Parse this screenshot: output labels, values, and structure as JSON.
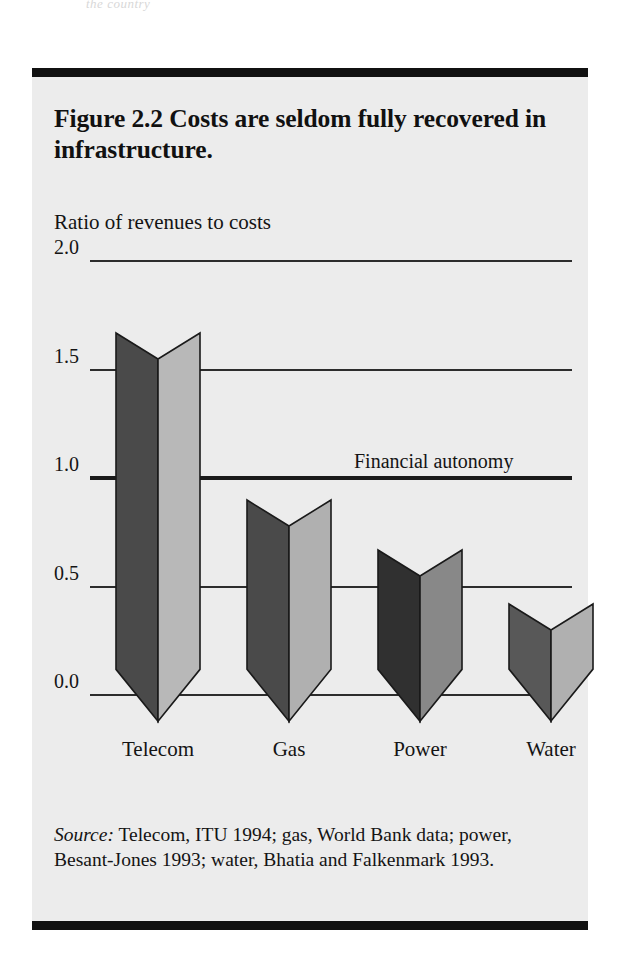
{
  "figure": {
    "title": "Figure 2.2  Costs are seldom fully recovered in infrastructure.",
    "axis_caption": "Ratio of revenues to costs",
    "source_prefix": "Source:",
    "source_text": " Telecom, ITU 1994; gas, World Bank data; power, Besant-Jones 1993; water, Bhatia and Falkenmark 1993.",
    "scan_artifact": "the country"
  },
  "colors": {
    "page_background": "#ffffff",
    "figure_background": "#ececec",
    "rule": "#111111",
    "gridline": "#2c2c2c",
    "text": "#141414",
    "bar_dark_default": "#4a4a4a",
    "bar_light_default": "#b8b8b8",
    "bar_dark_power": "#303030",
    "bar_light_power": "#888888",
    "bar_outline": "#1a1a1a"
  },
  "chart_data": {
    "type": "bar",
    "title": "Figure 2.2  Costs are seldom fully recovered in infrastructure.",
    "subtitle": "",
    "xlabel": "",
    "ylabel": "Ratio of revenues to costs",
    "categories": [
      "Telecom",
      "Gas",
      "Power",
      "Water"
    ],
    "values": [
      1.55,
      0.78,
      0.55,
      0.3
    ],
    "ylim": [
      0.0,
      2.0
    ],
    "yticks": [
      0.0,
      0.5,
      1.0,
      1.5,
      2.0
    ],
    "ytick_labels": [
      "0.0",
      "0.5",
      "1.0",
      "1.5",
      "2.0"
    ],
    "grid": true,
    "legend": "none",
    "annotations": [
      {
        "text": "Financial autonomy",
        "y": 1.0,
        "note": "Emphasized horizontal reference line at ratio = 1.0"
      }
    ],
    "style": "3d-prism-bars",
    "bar_shading": [
      {
        "category": "Telecom",
        "dark": "#4a4a4a",
        "light": "#b8b8b8"
      },
      {
        "category": "Gas",
        "dark": "#4a4a4a",
        "light": "#b0b0b0"
      },
      {
        "category": "Power",
        "dark": "#303030",
        "light": "#888888"
      },
      {
        "category": "Water",
        "dark": "#585858",
        "light": "#b0b0b0"
      }
    ]
  }
}
